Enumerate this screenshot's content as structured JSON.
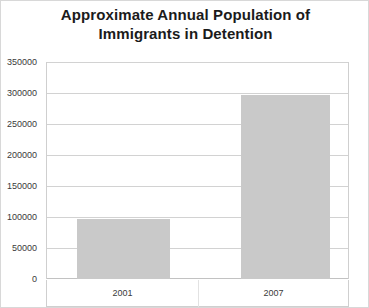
{
  "chart_data": {
    "type": "bar",
    "title": "Approximate Annual Population of Immigrants in Detention",
    "title_lines": [
      "Approximate Annual Population of",
      "Immigrants in Detention"
    ],
    "categories": [
      "2001",
      "2007"
    ],
    "values": [
      97000,
      298000
    ],
    "series": [
      {
        "name": "Immigrants in Detention",
        "values": [
          97000,
          298000
        ]
      }
    ],
    "xlabel": "",
    "ylabel": "",
    "ylim": [
      0,
      350000
    ],
    "ytick_step": 50000,
    "yticks": [
      0,
      50000,
      100000,
      150000,
      200000,
      250000,
      300000,
      350000
    ],
    "ytick_labels": [
      "0",
      "50000",
      "100000",
      "150000",
      "200000",
      "250000",
      "300000",
      "350000"
    ],
    "grid": true,
    "legend": false,
    "legend_position": "none",
    "bar_color": "#c9c9c9",
    "gridline_color": "#d2d2d2",
    "text_color": "#3a3a3a",
    "background_color": "#ffffff"
  }
}
